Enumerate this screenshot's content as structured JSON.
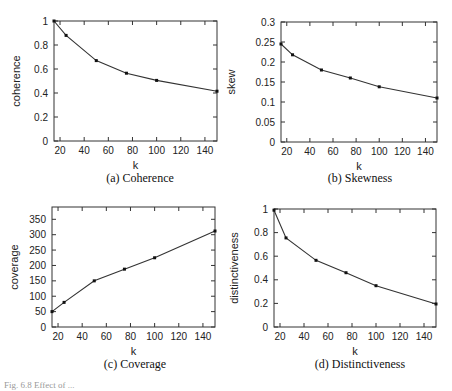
{
  "chart_data": [
    {
      "type": "line",
      "title": "",
      "caption": "(a) Coherence",
      "xlabel": "k",
      "ylabel": "coherence",
      "x": [
        15,
        25,
        50,
        75,
        100,
        150
      ],
      "values": [
        1.0,
        0.88,
        0.67,
        0.565,
        0.505,
        0.415
      ],
      "xlim": [
        15,
        150
      ],
      "ylim": [
        0,
        1
      ],
      "xticks": [
        20,
        40,
        60,
        80,
        100,
        120,
        140
      ],
      "yticks": [
        0,
        0.2,
        0.4,
        0.6,
        0.8,
        1
      ],
      "ytick_labels": [
        "0",
        "0.2",
        "0.4",
        "0.6",
        "0.8",
        "1"
      ],
      "grid": false,
      "legend": null
    },
    {
      "type": "line",
      "title": "",
      "caption": "(b) Skewness",
      "xlabel": "k",
      "ylabel": "skew",
      "x": [
        15,
        25,
        50,
        75,
        100,
        150
      ],
      "values": [
        0.245,
        0.218,
        0.18,
        0.16,
        0.138,
        0.11
      ],
      "xlim": [
        15,
        150
      ],
      "ylim": [
        0,
        0.3
      ],
      "xticks": [
        20,
        40,
        60,
        80,
        100,
        120,
        140
      ],
      "yticks": [
        0,
        0.05,
        0.1,
        0.15,
        0.2,
        0.25,
        0.3
      ],
      "ytick_labels": [
        "0",
        "0.05",
        "0.1",
        "0.15",
        "0.2",
        "0.25",
        "0.3"
      ],
      "grid": false,
      "legend": null
    },
    {
      "type": "line",
      "title": "",
      "caption": "(c) Coverage",
      "xlabel": "k",
      "ylabel": "coverage",
      "x": [
        15,
        25,
        50,
        75,
        100,
        150
      ],
      "values": [
        50,
        80,
        150,
        188,
        225,
        312
      ],
      "xlim": [
        15,
        150
      ],
      "ylim": [
        0,
        390
      ],
      "xticks": [
        20,
        40,
        60,
        80,
        100,
        120,
        140
      ],
      "yticks": [
        0,
        50,
        100,
        150,
        200,
        250,
        300,
        350
      ],
      "ytick_labels": [
        "0",
        "50",
        "100",
        "150",
        "200",
        "250",
        "300",
        "350"
      ],
      "grid": false,
      "legend": null
    },
    {
      "type": "line",
      "title": "",
      "caption": "(d) Distinctiveness",
      "xlabel": "k",
      "ylabel": "distinctiveness",
      "x": [
        15,
        25,
        50,
        75,
        100,
        150
      ],
      "values": [
        0.99,
        0.755,
        0.565,
        0.46,
        0.35,
        0.195
      ],
      "xlim": [
        15,
        150
      ],
      "ylim": [
        0,
        1
      ],
      "xticks": [
        20,
        40,
        60,
        80,
        100,
        120,
        140
      ],
      "yticks": [
        0,
        0.2,
        0.4,
        0.6,
        0.8,
        1
      ],
      "ytick_labels": [
        "0",
        "0.2",
        "0.4",
        "0.6",
        "0.8",
        "1"
      ],
      "grid": false,
      "legend": null
    }
  ],
  "figure": {
    "caption_partial": "Fig. 6.8 Effect of ..."
  }
}
